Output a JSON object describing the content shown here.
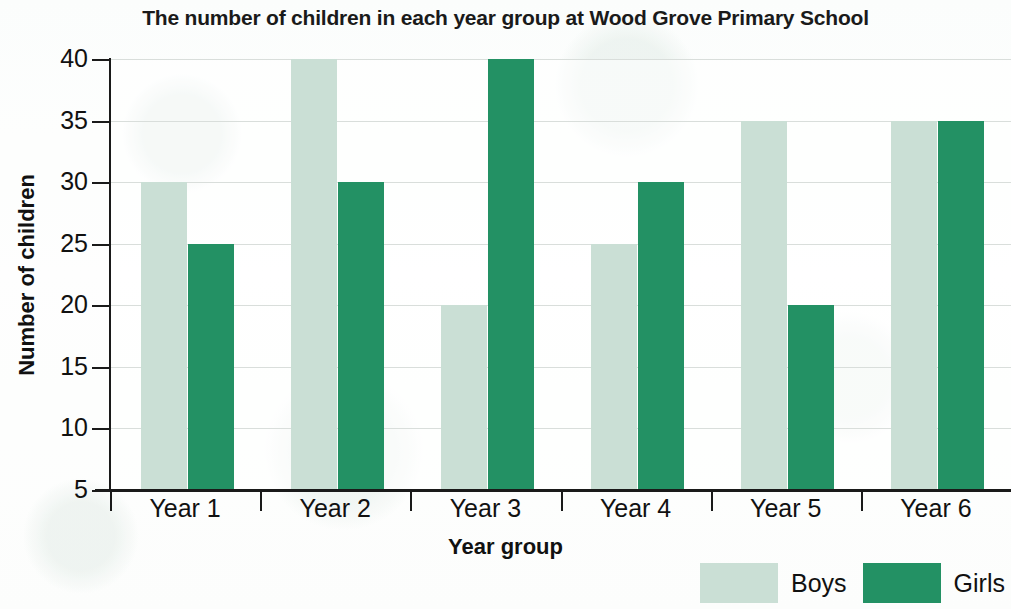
{
  "chart_data": {
    "type": "bar",
    "title": "The number of children in each year group at Wood Grove Primary School",
    "xlabel": "Year group",
    "ylabel": "Number of children",
    "categories": [
      "Year 1",
      "Year 2",
      "Year 3",
      "Year 4",
      "Year 5",
      "Year 6"
    ],
    "series": [
      {
        "name": "Boys",
        "color": "#cadfd5",
        "values": [
          30,
          40,
          20,
          25,
          35,
          35
        ]
      },
      {
        "name": "Girls",
        "color": "#239164",
        "values": [
          25,
          30,
          40,
          30,
          20,
          35
        ]
      }
    ],
    "ylim": [
      5,
      40
    ],
    "y_ticks": [
      5,
      10,
      15,
      20,
      25,
      30,
      35,
      40
    ],
    "y_tick_labels": [
      "5",
      "10",
      "15",
      "20",
      "25",
      "30",
      "35",
      "40"
    ],
    "grid": true,
    "legend_position": "bottom-right"
  },
  "legend": {
    "items": [
      {
        "label": "Boys",
        "swatch": "light-green-swatch"
      },
      {
        "label": "Girls",
        "swatch": "dark-green-swatch"
      }
    ]
  }
}
